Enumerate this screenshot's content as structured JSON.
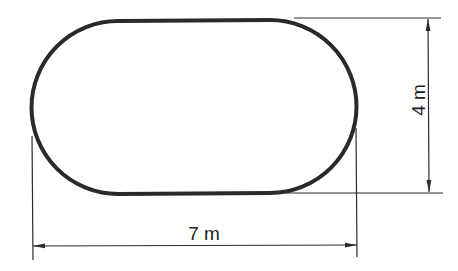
{
  "figure": {
    "type": "dimensioned technical drawing",
    "shape": "stadium (rectangle with semicircular ends)",
    "colors": {
      "stroke": "#2a2a2a",
      "background": "#ffffff"
    }
  },
  "dimensions": {
    "width": {
      "label": "7 m",
      "value": 7,
      "unit": "m",
      "orientation": "horizontal"
    },
    "height": {
      "label": "4 m",
      "value": 4,
      "unit": "m",
      "orientation": "vertical"
    }
  }
}
